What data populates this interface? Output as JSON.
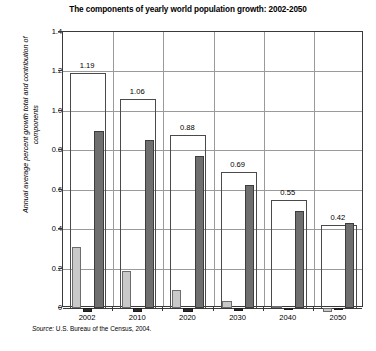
{
  "chart_data": {
    "type": "bar",
    "title": "The components of yearly world population growth: 2002-2050",
    "xlabel": "",
    "ylabel": "Annual average percent growth total and contribution of components",
    "categories": [
      "2002",
      "2010",
      "2020",
      "2030",
      "2040",
      "2050"
    ],
    "ylim": [
      0,
      1.4
    ],
    "ytick_labels": [
      "0",
      "0.2",
      "0.4",
      "0.6",
      "0.8",
      "1.0",
      "1.2",
      "1.4"
    ],
    "ytick_values": [
      0,
      0.2,
      0.4,
      0.6,
      0.8,
      1.0,
      1.2,
      1.4
    ],
    "grid": true,
    "legend_position": "top-right",
    "series": [
      {
        "name": "Fertility effect",
        "color": "#c9c9c9",
        "values": [
          0.31,
          0.19,
          0.09,
          0.035,
          0.01,
          -0.02
        ]
      },
      {
        "name": "Mortality effect",
        "color": "#2b2b2b",
        "values": [
          -0.02,
          -0.02,
          -0.02,
          -0.015,
          -0.01,
          -0.01
        ]
      },
      {
        "name": "Population momentum effect",
        "color": "#6f6f6f",
        "values": [
          0.9,
          0.85,
          0.77,
          0.625,
          0.49,
          0.43
        ]
      }
    ],
    "totals": {
      "label": "Total",
      "values": [
        1.19,
        1.06,
        0.88,
        0.69,
        0.55,
        0.42
      ],
      "display": [
        "1.19",
        "1.06",
        "0.88",
        "0.69",
        "0.55",
        "0.42"
      ]
    },
    "source": {
      "prefix": "Source:",
      "text": "U.S. Bureau of the Census, 2004."
    }
  }
}
